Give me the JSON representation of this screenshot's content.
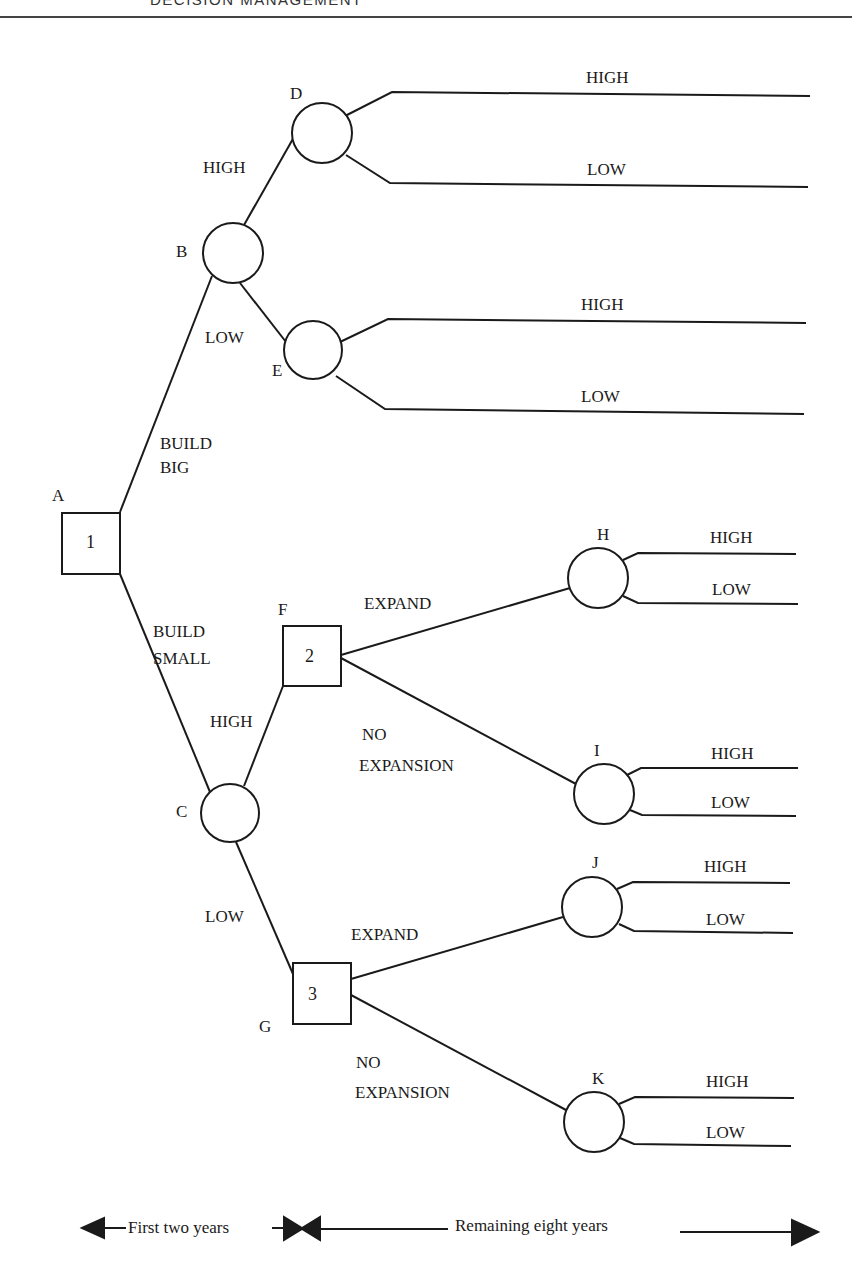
{
  "header": {
    "running_head": "DECISION MANAGEMENT"
  },
  "diagram": {
    "type": "decision-tree",
    "nodes": {
      "A": {
        "label": "A",
        "kind": "decision",
        "number": "1"
      },
      "B": {
        "label": "B",
        "kind": "chance"
      },
      "C": {
        "label": "C",
        "kind": "chance"
      },
      "D": {
        "label": "D",
        "kind": "chance"
      },
      "E": {
        "label": "E",
        "kind": "chance"
      },
      "F": {
        "label": "F",
        "kind": "decision",
        "number": "2"
      },
      "G": {
        "label": "G",
        "kind": "decision",
        "number": "3"
      },
      "H": {
        "label": "H",
        "kind": "chance"
      },
      "I": {
        "label": "I",
        "kind": "chance"
      },
      "J": {
        "label": "J",
        "kind": "chance"
      },
      "K": {
        "label": "K",
        "kind": "chance"
      }
    },
    "edges": {
      "a_b": {
        "line1": "BUILD",
        "line2": "BIG"
      },
      "a_c": {
        "line1": "BUILD",
        "line2": "SMALL"
      },
      "b_d": "HIGH",
      "b_e": "LOW",
      "d_high": "HIGH",
      "d_low": "LOW",
      "e_high": "HIGH",
      "e_low": "LOW",
      "c_f": "HIGH",
      "c_g": "LOW",
      "f_h": "EXPAND",
      "f_i": {
        "line1": "NO",
        "line2": "EXPANSION"
      },
      "g_j": "EXPAND",
      "g_k": {
        "line1": "NO",
        "line2": "EXPANSION"
      },
      "h_high": "HIGH",
      "h_low": "LOW",
      "i_high": "HIGH",
      "i_low": "LOW",
      "j_high": "HIGH",
      "j_low": "LOW",
      "k_high": "HIGH",
      "k_low": "LOW"
    },
    "timeline": {
      "first": "First two years",
      "remaining": "Remaining eight years"
    },
    "colors": {
      "stroke": "#1a1a1a",
      "background": "#ffffff"
    }
  }
}
